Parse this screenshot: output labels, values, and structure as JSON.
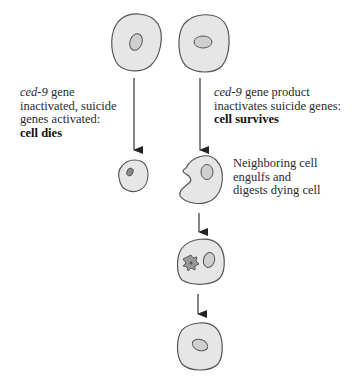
{
  "diagram": {
    "title": "",
    "colors": {
      "cell_fill": "#e6e6e6",
      "cell_stroke": "#555555",
      "nucleus_fill": "#cfcfcf",
      "dead_nucleus_fill": "#888888",
      "arrow": "#222222"
    },
    "left_path": {
      "label": {
        "gene_italic": "ced-9",
        "line1_rest": " gene",
        "line2": "inactivated, suicide",
        "line3": "genes activated:",
        "outcome_bold": "cell dies"
      },
      "stages": [
        "normal cell",
        "shrunken dying cell"
      ]
    },
    "right_path": {
      "label": {
        "gene_italic": "ced-9",
        "line1_rest": " gene product",
        "line2": "inactivates suicide genes:",
        "outcome_bold": "cell survives"
      },
      "stages": [
        "normal cell",
        "engulfing neighboring cell",
        "cell containing digested dying cell",
        "normal cell"
      ]
    },
    "engulf_label": {
      "line1": "Neighboring cell",
      "line2": "engulfs and",
      "line3": "digests dying cell"
    }
  }
}
